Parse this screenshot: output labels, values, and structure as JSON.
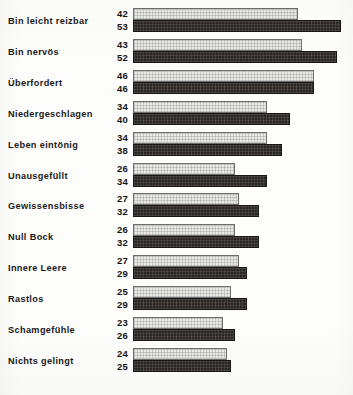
{
  "chart_data": {
    "type": "bar",
    "orientation": "horizontal",
    "title": "",
    "subtitle": "",
    "xlabel": "",
    "ylabel": "",
    "grid": false,
    "legend_position": "none",
    "axis_visible": false,
    "value_labels": true,
    "xlim": [
      0,
      56
    ],
    "categories": [
      "Bin leicht reizbar",
      "Bin nervös",
      "Überfordert",
      "Niedergeschlagen",
      "Leben eintönig",
      "Unausgefüllt",
      "Gewissensbisse",
      "Null Bock",
      "Innere Leere",
      "Rastlos",
      "Schamgefühle",
      "Nichts gelingt"
    ],
    "series": [
      {
        "name": "light",
        "color": "#e9e9e7",
        "values": [
          42,
          43,
          46,
          34,
          34,
          26,
          27,
          26,
          27,
          25,
          23,
          24
        ]
      },
      {
        "name": "dark",
        "color": "#2b2724",
        "values": [
          53,
          52,
          46,
          40,
          38,
          34,
          32,
          32,
          29,
          29,
          26,
          25
        ]
      }
    ]
  },
  "layout": {
    "bar_origin_x": 133,
    "px_per_unit": 3.93,
    "row_pitch": 30.9,
    "first_row_top": 7
  }
}
